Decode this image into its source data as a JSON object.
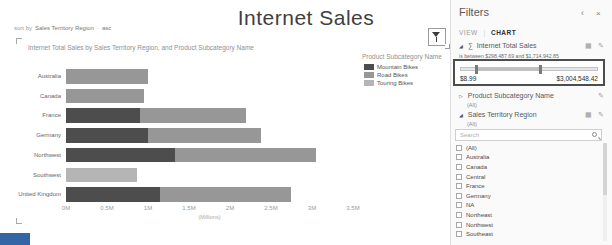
{
  "page": {
    "title": "Internet Sales"
  },
  "sort_bar": {
    "label": "sort by",
    "field": "Sales Territory Region",
    "separator": "·",
    "order": "asc"
  },
  "icons": {
    "collapse": "‹",
    "close": "×",
    "edit": "✎",
    "list": "▦",
    "sigma": "∑",
    "expander_open": "◢",
    "expander_closed": "▷"
  },
  "chart": {
    "title": "Internet Total Sales by Sales Territory Region, and Product Subcategory Name",
    "legend": {
      "title": "Product Subcategory Name",
      "items": [
        {
          "label": "Mountain Bikes",
          "color": "#4d4d4d"
        },
        {
          "label": "Road Bikes",
          "color": "#979797"
        },
        {
          "label": "Touring Bikes",
          "color": "#b5b5b5"
        }
      ]
    },
    "x_axis": {
      "ticks": [
        "0M",
        "0.5M",
        "1M",
        "1.5M",
        "2M",
        "2.5M",
        "3M",
        "3.5M"
      ],
      "values": [
        0,
        0.5,
        1,
        1.5,
        2,
        2.5,
        3,
        3.5
      ],
      "label": "(Millions)"
    }
  },
  "chart_data": {
    "type": "bar",
    "orientation": "horizontal",
    "stacked": true,
    "title": "Internet Total Sales by Sales Territory Region, and Product Subcategory Name",
    "categories": [
      "Australia",
      "Canada",
      "France",
      "Germany",
      "Northwest",
      "Southwest",
      "United Kingdom"
    ],
    "series": [
      {
        "name": "Mountain Bikes",
        "color": "#4d4d4d",
        "values": [
          0,
          0,
          0.9,
          1.0,
          1.33,
          0,
          1.15
        ]
      },
      {
        "name": "Road Bikes",
        "color": "#979797",
        "values": [
          1.0,
          0.95,
          1.3,
          1.38,
          1.72,
          0,
          1.6
        ]
      },
      {
        "name": "Touring Bikes",
        "color": "#b5b5b5",
        "values": [
          0,
          0,
          0,
          0,
          0,
          0.86,
          0
        ]
      }
    ],
    "units": "millions USD",
    "xlim": [
      0,
      3.5
    ],
    "xlabel": "(Millions)",
    "legend_position": "right",
    "grid": false
  },
  "filters_panel": {
    "title": "Filters",
    "tabs": [
      {
        "label": "VIEW",
        "active": false
      },
      {
        "label": "CHART",
        "active": true
      }
    ],
    "sales_measure": {
      "name": "Internet Total Sales",
      "condition": "is between $298,487.69 and $1,714,942.85",
      "range_min": "$8.99",
      "range_max": "$3,004,548.42",
      "handle_low_pct": 10,
      "handle_high_pct": 57
    },
    "subcategory": {
      "name": "Product Subcategory Name",
      "value": "(All)"
    },
    "territory": {
      "name": "Sales Territory Region",
      "value": "(All)",
      "search_placeholder": "Search",
      "items": [
        "(All)",
        "Australia",
        "Canada",
        "Central",
        "France",
        "Germany",
        "NA",
        "Northeast",
        "Northwest",
        "Southeast"
      ]
    }
  }
}
